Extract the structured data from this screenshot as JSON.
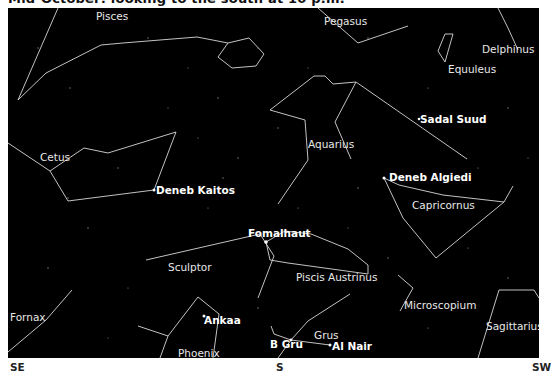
{
  "caption": "Mid-October: looking to the south at 10 p.m.",
  "constellations": [
    {
      "name": "Pisces",
      "x": 88,
      "y": 3
    },
    {
      "name": "Pegasus",
      "x": 316,
      "y": 8
    },
    {
      "name": "Delphinus",
      "x": 482,
      "y": 40
    },
    {
      "name": "Equuleus",
      "x": 447,
      "y": 57
    },
    {
      "name": "Cetus",
      "x": 32,
      "y": 144
    },
    {
      "name": "Aquarius",
      "x": 323,
      "y": 131
    },
    {
      "name": "Capricornus",
      "x": 414,
      "y": 192
    },
    {
      "name": "Sculptor",
      "x": 160,
      "y": 254
    },
    {
      "name": "Piscis Austrinus",
      "x": 288,
      "y": 264
    },
    {
      "name": "Microscopium",
      "x": 404,
      "y": 292
    },
    {
      "name": "Fornax",
      "x": 2,
      "y": 304
    },
    {
      "name": "Sagittarius",
      "x": 486,
      "y": 313
    },
    {
      "name": "Phoenix",
      "x": 170,
      "y": 340
    },
    {
      "name": "Grus",
      "x": 316,
      "y": 322
    }
  ],
  "stars": [
    {
      "name": "Sadal Suud",
      "x": 419,
      "y": 111
    },
    {
      "name": "Deneb Algiedi",
      "x": 390,
      "y": 170
    },
    {
      "name": "Deneb Kaitos",
      "x": 156,
      "y": 184
    },
    {
      "name": "Fomalhaut",
      "x": 248,
      "y": 226
    },
    {
      "name": "Ankaa",
      "x": 204,
      "y": 314
    },
    {
      "name": "B Gru",
      "x": 270,
      "y": 339
    },
    {
      "name": "Al Nair",
      "x": 333,
      "y": 341
    }
  ],
  "directions": [
    {
      "label": "SE",
      "x": 10
    },
    {
      "label": "S",
      "x": 276
    },
    {
      "label": "SW",
      "x": 532
    }
  ],
  "colors": {
    "sky": "#000000",
    "lines": "#d8d8d8",
    "labels": "#e8e8e8"
  }
}
